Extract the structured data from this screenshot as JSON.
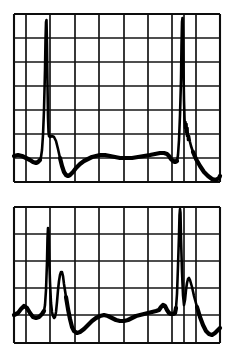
{
  "page": {
    "background_color": "#ffffff",
    "width": 234,
    "height": 359,
    "ink_color": "#000000",
    "grid_color": "#151515"
  },
  "chart_data": [
    {
      "id": "ecg-strip-upper",
      "type": "line",
      "title": "ECG Strip 1",
      "xlabel": "",
      "ylabel": "",
      "grid": true,
      "legend": null,
      "plot_box": {
        "x": 14,
        "y": 14,
        "width": 206,
        "height": 168
      },
      "grid_vertical_x": [
        14,
        26,
        50,
        75,
        99,
        124,
        148,
        172,
        184,
        196,
        220
      ],
      "grid_horizontal_y": [
        14,
        38,
        62,
        86,
        110,
        134,
        158,
        182
      ],
      "xlim": [
        0,
        206
      ],
      "ylim": [
        0,
        168
      ],
      "series": [
        {
          "name": "ecg-trace-1",
          "description": "ECG waveform with two tall R-wave spikes, baseline drift and T-waves",
          "points": [
            [
              14,
              156
            ],
            [
              18,
              155
            ],
            [
              22,
              156
            ],
            [
              26,
              158
            ],
            [
              30,
              160
            ],
            [
              33,
              162
            ],
            [
              36,
              163
            ],
            [
              38,
              162
            ],
            [
              40,
              160
            ],
            [
              41,
              157
            ],
            [
              42,
              150
            ],
            [
              43,
              135
            ],
            [
              44,
              110
            ],
            [
              45,
              70
            ],
            [
              45.5,
              40
            ],
            [
              46,
              22
            ],
            [
              46.5,
              20
            ],
            [
              47,
              45
            ],
            [
              47.5,
              85
            ],
            [
              48,
              118
            ],
            [
              48.5,
              132
            ],
            [
              49,
              136
            ],
            [
              50,
              137
            ],
            [
              52,
              136
            ],
            [
              54,
              137
            ],
            [
              56,
              141
            ],
            [
              58,
              149
            ],
            [
              60,
              158
            ],
            [
              62,
              166
            ],
            [
              64,
              172
            ],
            [
              66,
              175
            ],
            [
              68,
              176
            ],
            [
              70,
              175
            ],
            [
              73,
              172
            ],
            [
              76,
              168
            ],
            [
              80,
              164
            ],
            [
              84,
              161
            ],
            [
              88,
              159
            ],
            [
              92,
              157
            ],
            [
              96,
              156
            ],
            [
              100,
              155
            ],
            [
              105,
              155
            ],
            [
              110,
              156
            ],
            [
              115,
              157
            ],
            [
              120,
              158
            ],
            [
              126,
              158
            ],
            [
              132,
              158
            ],
            [
              138,
              157
            ],
            [
              144,
              156
            ],
            [
              150,
              155
            ],
            [
              155,
              154
            ],
            [
              160,
              153
            ],
            [
              164,
              153
            ],
            [
              167,
              154
            ],
            [
              169,
              156
            ],
            [
              171,
              159
            ],
            [
              173,
              161
            ],
            [
              175,
              162
            ],
            [
              177,
              161
            ],
            [
              178,
              155
            ],
            [
              179,
              140
            ],
            [
              180,
              115
            ],
            [
              181,
              80
            ],
            [
              181.5,
              45
            ],
            [
              182,
              22
            ],
            [
              182.5,
              18
            ],
            [
              183,
              35
            ],
            [
              183.5,
              70
            ],
            [
              184,
              100
            ],
            [
              184.5,
              118
            ],
            [
              185,
              128
            ],
            [
              185.5,
              122
            ],
            [
              186,
              132
            ],
            [
              186.5,
              124
            ],
            [
              187,
              136
            ],
            [
              187.5,
              128
            ],
            [
              188,
              140
            ],
            [
              189,
              136
            ],
            [
              190,
              142
            ],
            [
              191,
              146
            ],
            [
              193,
              152
            ],
            [
              196,
              159
            ],
            [
              200,
              166
            ],
            [
              204,
              172
            ],
            [
              208,
              176
            ],
            [
              212,
              179
            ],
            [
              216,
              180
            ],
            [
              219,
              178
            ],
            [
              220,
              176
            ]
          ]
        }
      ]
    },
    {
      "id": "ecg-strip-lower",
      "type": "line",
      "title": "ECG Strip 2",
      "xlabel": "",
      "ylabel": "",
      "grid": true,
      "legend": null,
      "plot_box": {
        "x": 14,
        "y": 207,
        "width": 206,
        "height": 136
      },
      "grid_vertical_x": [
        14,
        26,
        50,
        75,
        99,
        124,
        148,
        172,
        184,
        196,
        220
      ],
      "grid_horizontal_y": [
        207,
        234,
        261,
        288,
        315,
        343
      ],
      "xlim": [
        0,
        206
      ],
      "ylim": [
        0,
        136
      ],
      "series": [
        {
          "name": "ecg-trace-2",
          "description": "ECG waveform with two tall R-wave spikes, prominent T-waves and baseline",
          "points": [
            [
              14,
              315
            ],
            [
              18,
              313
            ],
            [
              21,
              309
            ],
            [
              24,
              306
            ],
            [
              27,
              308
            ],
            [
              30,
              313
            ],
            [
              33,
              317
            ],
            [
              36,
              318
            ],
            [
              39,
              317
            ],
            [
              42,
              314
            ],
            [
              44,
              311
            ],
            [
              45,
              305
            ],
            [
              46,
              290
            ],
            [
              47,
              262
            ],
            [
              47.5,
              238
            ],
            [
              48,
              228
            ],
            [
              48.5,
              231
            ],
            [
              49,
              252
            ],
            [
              50,
              282
            ],
            [
              51,
              303
            ],
            [
              52,
              312
            ],
            [
              53,
              316
            ],
            [
              54,
              318
            ],
            [
              55,
              317
            ],
            [
              56,
              312
            ],
            [
              57,
              302
            ],
            [
              58,
              290
            ],
            [
              59,
              281
            ],
            [
              60,
              275
            ],
            [
              61,
              272
            ],
            [
              62,
              272
            ],
            [
              63,
              276
            ],
            [
              64,
              284
            ],
            [
              66,
              297
            ],
            [
              68,
              309
            ],
            [
              70,
              319
            ],
            [
              72,
              327
            ],
            [
              74,
              331
            ],
            [
              77,
              333
            ],
            [
              80,
              332
            ],
            [
              84,
              329
            ],
            [
              88,
              325
            ],
            [
              92,
              321
            ],
            [
              96,
              318
            ],
            [
              100,
              316
            ],
            [
              104,
              315
            ],
            [
              108,
              316
            ],
            [
              112,
              318
            ],
            [
              116,
              320
            ],
            [
              120,
              321
            ],
            [
              124,
              321
            ],
            [
              128,
              320
            ],
            [
              132,
              318
            ],
            [
              136,
              316
            ],
            [
              140,
              315
            ],
            [
              144,
              314
            ],
            [
              148,
              313
            ],
            [
              152,
              312
            ],
            [
              156,
              311
            ],
            [
              159,
              310
            ],
            [
              161,
              307
            ],
            [
              163,
              305
            ],
            [
              165,
              306
            ],
            [
              167,
              310
            ],
            [
              169,
              313
            ],
            [
              171,
              314
            ],
            [
              173,
              314
            ],
            [
              175,
              313
            ],
            [
              176,
              308
            ],
            [
              177,
              294
            ],
            [
              178,
              266
            ],
            [
              179,
              235
            ],
            [
              179.5,
              215
            ],
            [
              180,
              209
            ],
            [
              180.5,
              213
            ],
            [
              181,
              238
            ],
            [
              182,
              272
            ],
            [
              183,
              295
            ],
            [
              184,
              305
            ],
            [
              185,
              300
            ],
            [
              186,
              290
            ],
            [
              187,
              283
            ],
            [
              188,
              279
            ],
            [
              189,
              278
            ],
            [
              190,
              280
            ],
            [
              192,
              287
            ],
            [
              194,
              296
            ],
            [
              197,
              307
            ],
            [
              200,
              317
            ],
            [
              203,
              325
            ],
            [
              206,
              331
            ],
            [
              209,
              334
            ],
            [
              212,
              335
            ],
            [
              215,
              333
            ],
            [
              218,
              330
            ],
            [
              220,
              328
            ]
          ]
        }
      ]
    }
  ]
}
